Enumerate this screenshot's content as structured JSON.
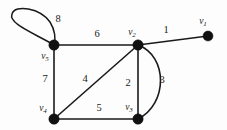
{
  "figure": {
    "kind": "undirected-multigraph-diagram",
    "background_color": "#fdfdfd",
    "ink_color": "#1a1a1a",
    "width": 227,
    "height": 130
  },
  "vertices": [
    {
      "id": "v1",
      "label_main": "v",
      "label_sub": "1",
      "x": 208,
      "y": 36,
      "label_x": 203,
      "label_y": 22,
      "radius": 5.0
    },
    {
      "id": "v2",
      "label_main": "v",
      "label_sub": "2",
      "x": 138,
      "y": 45,
      "label_x": 132,
      "label_y": 33,
      "radius": 5.2
    },
    {
      "id": "v3",
      "label_main": "v",
      "label_sub": "3",
      "x": 138,
      "y": 119,
      "label_x": 129,
      "label_y": 108,
      "radius": 5.2
    },
    {
      "id": "v4",
      "label_main": "v",
      "label_sub": "4",
      "x": 54,
      "y": 119,
      "label_x": 43,
      "label_y": 109,
      "radius": 5.2
    },
    {
      "id": "v5",
      "label_main": "v",
      "label_sub": "5",
      "x": 54,
      "y": 45,
      "label_x": 45,
      "label_y": 57,
      "radius": 5.2
    }
  ],
  "edges": [
    {
      "id": "e1",
      "label": "1",
      "from": "v2",
      "to": "v1",
      "shape": "straight",
      "label_x": 166,
      "label_y": 30
    },
    {
      "id": "e2",
      "label": "2",
      "from": "v2",
      "to": "v3",
      "shape": "straight",
      "label_x": 128,
      "label_y": 83
    },
    {
      "id": "e3",
      "label": "3",
      "from": "v2",
      "to": "v3",
      "shape": "curve-right",
      "bulge_x": 168,
      "label_x": 162,
      "label_y": 80
    },
    {
      "id": "e4",
      "label": "4",
      "from": "v2",
      "to": "v4",
      "shape": "straight",
      "label_x": 85,
      "label_y": 79
    },
    {
      "id": "e5",
      "label": "5",
      "from": "v4",
      "to": "v3",
      "shape": "straight",
      "label_x": 99,
      "label_y": 108
    },
    {
      "id": "e6",
      "label": "6",
      "from": "v5",
      "to": "v2",
      "shape": "straight",
      "label_x": 97,
      "label_y": 34
    },
    {
      "id": "e7",
      "label": "7",
      "from": "v5",
      "to": "v4",
      "shape": "straight",
      "label_x": 45,
      "label_y": 79
    },
    {
      "id": "e8",
      "label": "8",
      "from": "v5",
      "to": "v5",
      "shape": "self-loop-upper-left",
      "label_x": 58,
      "label_y": 19
    }
  ],
  "geometry": {
    "edge_paths": {
      "e1": "M 138 45 L 208 36",
      "e2": "M 138 45 L 138 119",
      "e3": "M 138 45 C 168 56, 168 104, 138 119",
      "e4": "M 138 45 L 54 119",
      "e5": "M 54 119 L 138 119",
      "e6": "M 54 45 L 138 45",
      "e7": "M 54 45 L 54 119",
      "e8": "M 54 45 C 36 34, 8 24, 12 14 C 15 4, 40 8, 50 22 C 55 30, 56 39, 54 45"
    }
  }
}
